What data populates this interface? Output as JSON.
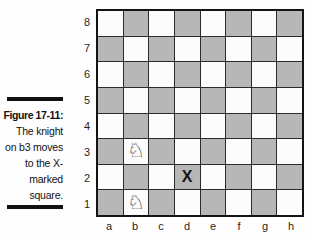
{
  "figure": {
    "label": "Figure 17-11:",
    "caption_lines": [
      "The knight",
      "on b3 moves",
      "to the X-",
      "marked",
      "square."
    ]
  },
  "board": {
    "files": [
      "a",
      "b",
      "c",
      "d",
      "e",
      "f",
      "g",
      "h"
    ],
    "ranks": [
      "8",
      "7",
      "6",
      "5",
      "4",
      "3",
      "2",
      "1"
    ],
    "colors": {
      "light_square": "#fcfcfc",
      "dark_square": "#b7b7b7",
      "grid_line": "#2b2b2b",
      "border": "#141414",
      "caption_rule": "#111111"
    },
    "pieces": [
      {
        "square": "b3",
        "name": "white-knight",
        "glyph": "♘"
      },
      {
        "square": "b1",
        "name": "white-knight",
        "glyph": "♘"
      }
    ],
    "marks": [
      {
        "square": "d2",
        "text": "X"
      }
    ]
  }
}
